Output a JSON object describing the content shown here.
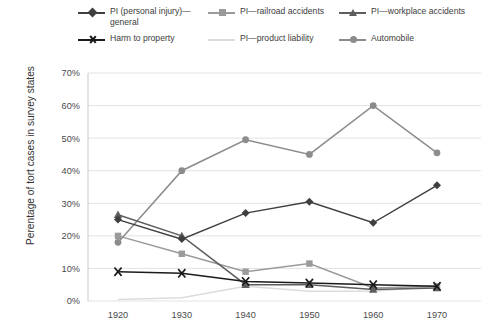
{
  "chart_data": {
    "type": "line",
    "title": "",
    "xlabel": "",
    "ylabel": "Perentage of tort cases in survey states",
    "x": [
      1920,
      1930,
      1940,
      1950,
      1960,
      1970
    ],
    "categories": [
      "1920",
      "1930",
      "1940",
      "1950",
      "1960",
      "1970"
    ],
    "ylim": [
      0,
      70
    ],
    "yticks": [
      0,
      10,
      20,
      30,
      40,
      50,
      60,
      70
    ],
    "ytick_labels": [
      "0%",
      "10%",
      "20%",
      "30%",
      "40%",
      "50%",
      "60%",
      "70%"
    ],
    "xtick_labels": [
      "1920",
      "1930",
      "1940",
      "1950",
      "1960",
      "1970"
    ],
    "grid": true,
    "legend_position": "top",
    "series": [
      {
        "name": "PI (personal injury)—general",
        "legend_label_line1": "PI (personal injury)—",
        "legend_label_line2": "general",
        "color": "#3f3f3f",
        "marker": "diamond",
        "values": [
          25,
          19,
          27,
          30.5,
          24,
          35.5
        ]
      },
      {
        "name": "PI—railroad accidents",
        "color": "#9a9a9a",
        "marker": "square",
        "values": [
          20,
          14.5,
          9,
          11.5,
          4,
          4.5
        ]
      },
      {
        "name": "PI—workplace accidents",
        "color": "#5e5e5e",
        "marker": "triangle",
        "values": [
          26.5,
          20,
          5,
          5,
          3.5,
          4
        ]
      },
      {
        "name": "Harm to property",
        "color": "#1b1b1b",
        "marker": "x",
        "values": [
          9,
          8.5,
          6,
          5.5,
          5,
          4.5
        ]
      },
      {
        "name": "PI—product liability",
        "color": "#dcdcdc",
        "marker": "none",
        "values": [
          0.5,
          1,
          4.5,
          3,
          3,
          4.5
        ]
      },
      {
        "name": "Automobile",
        "color": "#8c8c8c",
        "marker": "circle",
        "values": [
          18,
          40,
          49.5,
          45,
          60,
          45.5
        ]
      }
    ]
  },
  "legend": {
    "items": [
      {
        "label": "PI (personal injury)—\ngeneral",
        "series": 0
      },
      {
        "label": "PI—railroad accidents",
        "series": 1
      },
      {
        "label": "PI—workplace accidents",
        "series": 2
      },
      {
        "label": "Harm to property",
        "series": 3
      },
      {
        "label": "PI—product liability",
        "series": 4
      },
      {
        "label": "Automobile",
        "series": 5
      }
    ]
  },
  "colors": {
    "grid": "#e3e3e3",
    "axis": "#c9c9c9",
    "text": "#3d3d3d",
    "background": "#ffffff"
  }
}
